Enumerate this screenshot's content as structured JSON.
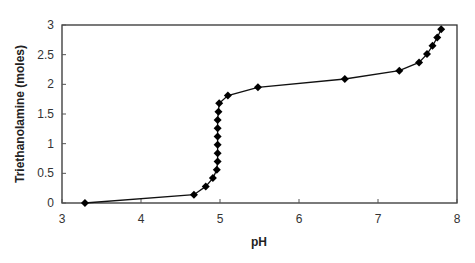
{
  "chart_data": {
    "type": "line",
    "title": "",
    "xlabel": "pH",
    "ylabel": "Triethanolamine (moles)",
    "xlim": [
      3,
      8
    ],
    "ylim": [
      0,
      3
    ],
    "x_ticks": [
      "3",
      "4",
      "5",
      "6",
      "7",
      "8"
    ],
    "y_ticks": [
      "0",
      "0.5",
      "1",
      "1.5",
      "2",
      "2.5",
      "3"
    ],
    "grid": false,
    "legend": null,
    "marker": "diamond",
    "series": [
      {
        "name": "Titration curve",
        "color": "#000000",
        "points": [
          {
            "x": 3.29,
            "y": 0.0
          },
          {
            "x": 4.67,
            "y": 0.14
          },
          {
            "x": 4.82,
            "y": 0.28
          },
          {
            "x": 4.91,
            "y": 0.42
          },
          {
            "x": 4.96,
            "y": 0.56
          },
          {
            "x": 4.97,
            "y": 0.7
          },
          {
            "x": 4.97,
            "y": 0.84
          },
          {
            "x": 4.97,
            "y": 0.98
          },
          {
            "x": 4.97,
            "y": 1.12
          },
          {
            "x": 4.97,
            "y": 1.26
          },
          {
            "x": 4.97,
            "y": 1.4
          },
          {
            "x": 4.98,
            "y": 1.54
          },
          {
            "x": 4.99,
            "y": 1.68
          },
          {
            "x": 5.1,
            "y": 1.81
          },
          {
            "x": 5.48,
            "y": 1.95
          },
          {
            "x": 6.58,
            "y": 2.09
          },
          {
            "x": 7.27,
            "y": 2.23
          },
          {
            "x": 7.52,
            "y": 2.37
          },
          {
            "x": 7.62,
            "y": 2.51
          },
          {
            "x": 7.69,
            "y": 2.65
          },
          {
            "x": 7.75,
            "y": 2.79
          },
          {
            "x": 7.8,
            "y": 2.93
          }
        ]
      }
    ]
  }
}
